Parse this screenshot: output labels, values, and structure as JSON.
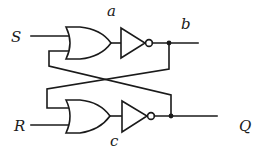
{
  "diagram": {
    "type": "SR latch (cross-coupled NOR)",
    "labels": {
      "input_s": "S",
      "input_r": "R",
      "node_a": "a",
      "node_b": "b",
      "node_c": "c",
      "output_q": "Q"
    },
    "components": [
      {
        "id": "or-top",
        "kind": "OR gate",
        "inputs": [
          "S",
          "feedback-from-bottom"
        ]
      },
      {
        "id": "not-top",
        "kind": "NOT gate",
        "input": "a",
        "output": "b"
      },
      {
        "id": "or-bottom",
        "kind": "OR gate",
        "inputs": [
          "feedback-from-top",
          "R"
        ]
      },
      {
        "id": "not-bottom",
        "kind": "NOT gate",
        "input": "c",
        "output": "Q"
      }
    ],
    "connections": [
      "b feeds back to lower OR gate input (crossed wire)",
      "Q feeds back to upper OR gate input (crossed wire)"
    ],
    "colors": {
      "stroke": "#1a1a1a",
      "background": "#ffffff"
    }
  }
}
